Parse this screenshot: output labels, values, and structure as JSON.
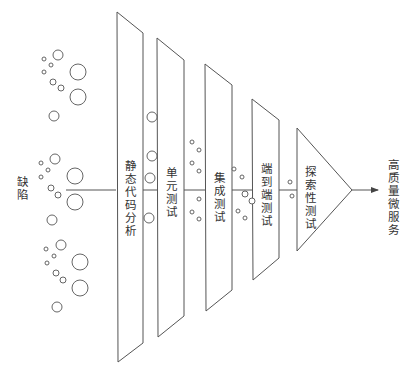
{
  "diagram": {
    "title": "",
    "colors": {
      "stroke": "#555555",
      "text": "#333333",
      "background": "#ffffff"
    },
    "input_label": "缺陷",
    "output_label": "高质量微服务",
    "stages": [
      {
        "id": "static-analysis",
        "label": "静态代码分析"
      },
      {
        "id": "unit-test",
        "label": "单元测试"
      },
      {
        "id": "integration-test",
        "label": "集成测试"
      },
      {
        "id": "e2e-test",
        "label": "端到端测试"
      },
      {
        "id": "exploratory-test",
        "label": "探索性测试"
      }
    ],
    "flow": "缺陷 → 静态代码分析 → 单元测试 → 集成测试 → 端到端测试 → 探索性测试 → 高质量微服务",
    "defects": {
      "left_cluster": [
        {
          "cx": 58,
          "cy": 55,
          "r": 5
        },
        {
          "cx": 44,
          "cy": 59,
          "r": 2
        },
        {
          "cx": 51,
          "cy": 65,
          "r": 2
        },
        {
          "cx": 44,
          "cy": 72,
          "r": 2
        },
        {
          "cx": 78,
          "cy": 72,
          "r": 8
        },
        {
          "cx": 53,
          "cy": 82,
          "r": 3
        },
        {
          "cx": 61,
          "cy": 88,
          "r": 3
        },
        {
          "cx": 78,
          "cy": 97,
          "r": 8
        },
        {
          "cx": 54,
          "cy": 116,
          "r": 5
        },
        {
          "cx": 55,
          "cy": 159,
          "r": 5
        },
        {
          "cx": 41,
          "cy": 163,
          "r": 2
        },
        {
          "cx": 48,
          "cy": 170,
          "r": 2
        },
        {
          "cx": 41,
          "cy": 177,
          "r": 2
        },
        {
          "cx": 75,
          "cy": 176,
          "r": 8
        },
        {
          "cx": 51,
          "cy": 188,
          "r": 3
        },
        {
          "cx": 58,
          "cy": 195,
          "r": 3
        },
        {
          "cx": 75,
          "cy": 202,
          "r": 8
        },
        {
          "cx": 52,
          "cy": 220,
          "r": 5
        },
        {
          "cx": 61,
          "cy": 245,
          "r": 5
        },
        {
          "cx": 46,
          "cy": 249,
          "r": 2
        },
        {
          "cx": 54,
          "cy": 256,
          "r": 2
        },
        {
          "cx": 47,
          "cy": 263,
          "r": 2
        },
        {
          "cx": 80,
          "cy": 262,
          "r": 8
        },
        {
          "cx": 56,
          "cy": 273,
          "r": 3
        },
        {
          "cx": 63,
          "cy": 280,
          "r": 3
        },
        {
          "cx": 80,
          "cy": 288,
          "r": 8
        },
        {
          "cx": 57,
          "cy": 307,
          "r": 5
        }
      ],
      "after_static": [
        {
          "cx": 152,
          "cy": 117,
          "r": 5
        },
        {
          "cx": 152,
          "cy": 156,
          "r": 5
        },
        {
          "cx": 150,
          "cy": 178,
          "r": 5
        },
        {
          "cx": 149,
          "cy": 218,
          "r": 5
        }
      ],
      "after_unit": [
        {
          "cx": 192,
          "cy": 142,
          "r": 2
        },
        {
          "cx": 199,
          "cy": 150,
          "r": 2
        },
        {
          "cx": 192,
          "cy": 163,
          "r": 2
        },
        {
          "cx": 199,
          "cy": 171,
          "r": 2
        },
        {
          "cx": 199,
          "cy": 199,
          "r": 2
        },
        {
          "cx": 192,
          "cy": 212,
          "r": 2
        },
        {
          "cx": 199,
          "cy": 219,
          "r": 2
        }
      ],
      "after_integration": [
        {
          "cx": 234,
          "cy": 169,
          "r": 2
        },
        {
          "cx": 242,
          "cy": 177,
          "r": 2
        },
        {
          "cx": 245,
          "cy": 194,
          "r": 3
        },
        {
          "cx": 252,
          "cy": 201,
          "r": 3
        },
        {
          "cx": 238,
          "cy": 211,
          "r": 2
        },
        {
          "cx": 245,
          "cy": 218,
          "r": 2
        }
      ],
      "after_e2e": [
        {
          "cx": 290,
          "cy": 182,
          "r": 2
        },
        {
          "cx": 292,
          "cy": 196,
          "r": 2
        }
      ]
    }
  }
}
